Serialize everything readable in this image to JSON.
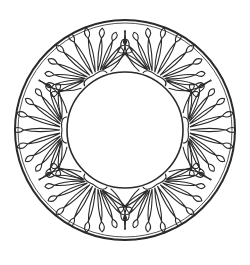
{
  "figure": {
    "style": "black outline on white, coloring-page style",
    "stroke_color": "#2a2a2a",
    "background_color": "#ffffff"
  },
  "geometry": {
    "center": [
      125,
      130
    ],
    "outer_radius": 110,
    "inner_radius": 58,
    "fan_count": 6,
    "fan_angles_deg": [
      0,
      60,
      120,
      180,
      240,
      300
    ],
    "petals_per_fan": 11
  }
}
